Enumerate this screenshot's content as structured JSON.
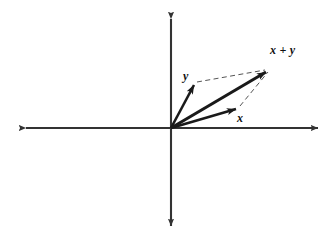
{
  "figure": {
    "name": "vector-addition-parallelogram",
    "background_color": "#ffffff",
    "width": 333,
    "height": 243,
    "stroke_color": "#1a1a1a",
    "axis_color": "#333333",
    "dashed_color": "#555555"
  },
  "axes": {
    "origin": {
      "x": 171,
      "y": 128
    },
    "horizontal": {
      "label": "",
      "from": {
        "x": 22,
        "y": 128
      },
      "to": {
        "x": 322,
        "y": 128
      },
      "arrow_both_ends": true
    },
    "vertical": {
      "label": "",
      "from": {
        "x": 171,
        "y": 15
      },
      "to": {
        "x": 171,
        "y": 230
      },
      "arrow_both_ends": true
    }
  },
  "vectors": [
    {
      "id": "y",
      "label": "y",
      "label_x": 183,
      "label_y": 70,
      "tip": {
        "x": 196,
        "y": 82
      },
      "style": "solid"
    },
    {
      "id": "x",
      "label": "x",
      "label_x": 237,
      "label_y": 112,
      "tip": {
        "x": 239,
        "y": 107
      },
      "style": "solid"
    },
    {
      "id": "x-plus-y",
      "label": "x + y",
      "label_x": 270,
      "label_y": 44,
      "tip": {
        "x": 270,
        "y": 68
      },
      "style": "solid"
    }
  ],
  "construction_lines": [
    {
      "id": "y-to-sum",
      "from": {
        "x": 196,
        "y": 82
      },
      "to": {
        "x": 268,
        "y": 69
      },
      "style": "dashed"
    },
    {
      "id": "x-to-sum",
      "from": {
        "x": 240,
        "y": 107
      },
      "to": {
        "x": 269,
        "y": 70
      },
      "style": "dashed"
    }
  ]
}
